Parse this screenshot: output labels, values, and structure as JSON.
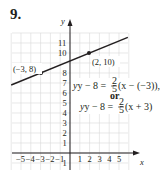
{
  "problem": {
    "number": "9."
  },
  "axes": {
    "x_label": "x",
    "y_label": "y"
  },
  "points": [
    {
      "label": "(−3, 8)",
      "x": -3,
      "y": 8
    },
    {
      "label": "(2, 10)",
      "x": 2,
      "y": 10
    }
  ],
  "equations": {
    "line1_lhs": "y − 8 = ",
    "line1_frac_num": "2",
    "line1_frac_den": "5",
    "line1_rhs": "(x − (−3)),",
    "connector": "or",
    "line2_lhs": "y − 8 = ",
    "line2_frac_num": "2",
    "line2_frac_den": "5",
    "line2_rhs": "(x + 3)"
  },
  "colors": {
    "grid": "#d9d9d9",
    "axis": "#231f20",
    "line": "#231f20"
  },
  "chart_data": {
    "type": "line",
    "title": "9.",
    "xlabel": "x",
    "ylabel": "y",
    "xlim": [
      -6,
      6
    ],
    "ylim": [
      -1.5,
      12
    ],
    "grid": true,
    "x_ticks": [
      -5,
      -4,
      -3,
      -2,
      -1,
      1,
      2,
      3,
      4,
      5
    ],
    "y_ticks": [
      -1,
      1,
      2,
      3,
      4,
      5,
      6,
      7,
      8,
      10,
      11
    ],
    "series": [
      {
        "name": "line through (−3, 8) and (2, 10)",
        "slope": 0.4,
        "x": [
          -6,
          -3,
          2,
          6
        ],
        "y": [
          6.8,
          8,
          10,
          11.6
        ]
      }
    ],
    "annotations": [
      "(−3, 8)",
      "(2, 10)",
      "y − 8 = 2/5(x − (−3)),",
      "or",
      "y − 8 = 2/5(x + 3)"
    ]
  }
}
